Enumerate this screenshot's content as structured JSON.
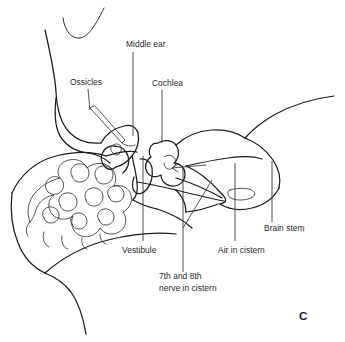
{
  "figure": {
    "panel_letter": "C",
    "background_color": "#ffffff",
    "line_color": "#1b1b1f",
    "text_color": "#26262b",
    "width": 345,
    "height": 342,
    "modality": "line-drawing"
  },
  "labels": {
    "middle_ear": "Middle ear",
    "ossicles": "Ossicles",
    "cochlea": "Cochlea",
    "vestibule": "Vestibule",
    "nerve_line1": "7th and 8th",
    "nerve_line2": "nerve in cistern",
    "air_in_cistern": "Air in cistern",
    "brain_stem": "Brain stem"
  },
  "label_positions": {
    "middle_ear": {
      "x": 126,
      "y": 47,
      "anchor": "start"
    },
    "ossicles": {
      "x": 70,
      "y": 85,
      "anchor": "start"
    },
    "cochlea": {
      "x": 152,
      "y": 86,
      "anchor": "start"
    },
    "vestibule": {
      "x": 122,
      "y": 253,
      "anchor": "start"
    },
    "nerve_line1": {
      "x": 159,
      "y": 279,
      "anchor": "start"
    },
    "nerve_line2": {
      "x": 159,
      "y": 291,
      "anchor": "start"
    },
    "air_in_cistern": {
      "x": 218,
      "y": 253,
      "anchor": "start"
    },
    "brain_stem": {
      "x": 264,
      "y": 231,
      "anchor": "start"
    },
    "panel_letter": {
      "x": 299,
      "y": 320,
      "anchor": "start"
    }
  },
  "leaders": [
    {
      "name": "middle-ear-leader",
      "d": "M 133 52 L 133 136"
    },
    {
      "name": "ossicles-leader",
      "d": "M 88 89 L 90 110"
    },
    {
      "name": "cochlea-leader",
      "d": "M 162 90 L 162 143"
    },
    {
      "name": "vestibule-leader",
      "d": "M 143 156 L 143 241"
    },
    {
      "name": "nerve-leader-vertical",
      "d": "M 183 168 L 183 272"
    },
    {
      "name": "nerve-leader-diagonal",
      "d": "M 183 228 L 212 180"
    },
    {
      "name": "air-in-cistern-leader",
      "d": "M 235 163 L 235 241"
    },
    {
      "name": "brain-stem-leader",
      "d": "M 272 161 L 272 222"
    }
  ],
  "anatomy_paths": [
    {
      "name": "pinna-arc",
      "weight": "thin",
      "d": "M 63 18 C 65 32 72 39 80 38 C 90 36 97 22 104 8"
    },
    {
      "name": "scalp-outline-upper",
      "weight": "main",
      "d": "M 45 30 C 50 52 55 74 56 92 C 57 110 61 124 70 133 C 78 141 90 144 101 143"
    },
    {
      "name": "scalp-outline-lower",
      "weight": "main",
      "d": "M 56 98 C 54 116 55 130 62 139 C 68 147 78 152 88 153"
    },
    {
      "name": "skull-base-left",
      "weight": "main",
      "d": "M 12 193 C 20 175 36 161 56 156 C 76 151 94 152 106 156"
    },
    {
      "name": "neck-outline-left",
      "weight": "main",
      "d": "M 12 193 C 10 210 12 228 18 243 C 24 258 34 268 45 273"
    },
    {
      "name": "neck-outline-lower",
      "weight": "main",
      "d": "M 45 273 C 55 277 64 283 71 292 C 78 302 83 316 86 334"
    },
    {
      "name": "skull-base-right",
      "weight": "main",
      "d": "M 45 273 C 62 258 84 246 108 240 C 132 234 156 232 176 234"
    },
    {
      "name": "posterior-fossa-rim",
      "weight": "main",
      "d": "M 106 156 C 118 152 128 150 137 152"
    },
    {
      "name": "mastoid-cells-outer",
      "weight": "fine",
      "d": "M 30 222 C 26 212 28 200 36 192 C 43 184 52 180 60 178 C 55 170 60 162 69 160 C 78 158 84 162 87 168 C 94 162 104 162 110 167 C 116 172 117 180 114 186 C 122 184 129 188 131 195 C 133 202 129 209 123 212 C 128 219 126 228 119 232 C 112 236 104 234 100 228 C 96 236 86 239 79 235 C 72 231 70 223 73 216 C 66 221 57 220 52 214 C 47 208 48 199 54 195 C 46 196 38 202 36 210 C 34 217 31 221 30 222 Z"
    },
    {
      "name": "mastoid-cell-a",
      "weight": "fine",
      "d": "M 48 192 C 44 188 45 181 50 178 C 55 175 61 177 63 182 C 65 187 62 193 57 194 C 53 195 50 194 48 192 Z"
    },
    {
      "name": "mastoid-cell-b",
      "weight": "fine",
      "d": "M 72 176 C 69 171 72 165 78 164 C 84 163 89 167 89 173 C 89 178 85 182 80 182 C 76 182 73 180 72 176 Z"
    },
    {
      "name": "mastoid-cell-c",
      "weight": "fine",
      "d": "M 96 178 C 93 173 96 167 102 166 C 108 165 113 169 113 175 C 113 180 109 184 104 184 C 100 184 97 182 96 178 Z"
    },
    {
      "name": "mastoid-cell-d",
      "weight": "fine",
      "d": "M 60 205 C 57 200 60 194 66 193 C 72 192 77 196 77 202 C 77 207 73 211 68 211 C 64 211 61 209 60 205 Z"
    },
    {
      "name": "mastoid-cell-e",
      "weight": "fine",
      "d": "M 86 200 C 83 195 86 189 92 188 C 98 187 103 191 103 197 C 103 202 99 206 94 206 C 90 206 87 204 86 200 Z"
    },
    {
      "name": "mastoid-cell-f",
      "weight": "fine",
      "d": "M 109 197 C 106 193 108 187 114 186 C 119 185 124 189 124 194 C 124 199 120 202 116 202 C 112 202 110 200 109 197 Z"
    },
    {
      "name": "mastoid-cell-g",
      "weight": "fine",
      "d": "M 44 218 C 41 214 43 208 49 207 C 54 206 59 210 59 215 C 59 220 55 223 51 223 C 47 223 45 221 44 218 Z"
    },
    {
      "name": "mastoid-cell-h",
      "weight": "fine",
      "d": "M 72 224 C 69 220 71 214 77 213 C 82 212 87 216 87 221 C 87 226 83 229 79 229 C 75 229 73 227 72 224 Z"
    },
    {
      "name": "mastoid-cell-i",
      "weight": "fine",
      "d": "M 99 220 C 96 216 98 210 104 209 C 109 208 114 212 114 217 C 114 222 110 225 106 225 C 102 225 100 223 99 220 Z"
    },
    {
      "name": "mastoid-fringe-1",
      "weight": "fine",
      "d": "M 30 222 C 26 226 25 232 28 236"
    },
    {
      "name": "mastoid-fringe-2",
      "weight": "fine",
      "d": "M 44 232 C 42 238 44 245 49 247"
    },
    {
      "name": "mastoid-fringe-3",
      "weight": "fine",
      "d": "M 62 236 C 61 242 63 248 68 249"
    },
    {
      "name": "mastoid-fringe-4",
      "weight": "fine",
      "d": "M 82 238 C 81 243 83 248 87 249"
    },
    {
      "name": "mastoid-fringe-5",
      "weight": "fine",
      "d": "M 100 234 C 100 239 102 243 106 244"
    },
    {
      "name": "epitympanum-outline",
      "weight": "main",
      "d": "M 101 143 C 106 134 115 128 124 126 C 131 124 136 127 138 133 C 140 141 137 150 132 156 C 127 162 121 166 116 167"
    },
    {
      "name": "middle-ear-cavity",
      "weight": "main",
      "d": "M 116 167 C 112 170 108 170 105 167 C 101 163 100 157 103 152 C 105 148 110 145 115 146"
    },
    {
      "name": "tympanic-wall",
      "weight": "main",
      "d": "M 115 146 C 121 146 126 150 128 156 C 130 162 128 169 123 173"
    },
    {
      "name": "ossicle-body",
      "weight": "fine",
      "d": "M 113 153 C 110 151 110 147 113 145 C 116 143 120 144 121 147 C 122 151 120 154 117 155 C 115 155 114 154 113 153 Z"
    },
    {
      "name": "ossicles-pointer",
      "weight": "fine",
      "d": "M 90 108 L 122 143 L 125 140 L 95 106 Z"
    },
    {
      "name": "ossicles-pointer-tip",
      "weight": "fine",
      "d": "M 122 143 C 126 146 131 147 135 145"
    },
    {
      "name": "eac-upper",
      "weight": "main",
      "d": "M 88 153 C 96 154 104 158 110 163"
    },
    {
      "name": "iac-descender",
      "weight": "main",
      "d": "M 132 156 C 134 165 136 173 137 182 C 138 190 137 196 133 200"
    },
    {
      "name": "vestibule-body",
      "weight": "main",
      "d": "M 140 159 C 146 158 151 162 152 168 C 153 176 151 184 147 189 C 143 194 138 195 135 192 C 132 189 132 183 134 177"
    },
    {
      "name": "cochlea-outer",
      "weight": "main",
      "d": "M 158 143 C 164 139 172 140 176 145 C 180 151 179 159 174 163 C 180 163 185 168 185 174 C 185 181 180 186 173 186 C 166 186 161 181 161 175 C 156 178 150 177 147 172 C 144 167 146 160 151 157 C 148 153 149 147 153 144 C 155 143 157 143 158 143 Z"
    },
    {
      "name": "cochlea-turn-inner",
      "weight": "fine",
      "d": "M 164 157 C 168 154 173 155 175 159 C 177 163 175 168 171 169 C 167 170 164 167 164 163"
    },
    {
      "name": "petrous-ridge-upper",
      "weight": "main",
      "d": "M 176 145 C 186 136 198 131 211 130 C 224 129 236 132 245 138"
    },
    {
      "name": "petrous-apex-curve",
      "weight": "main",
      "d": "M 245 138 C 252 130 262 122 274 115 C 290 106 310 99 334 96"
    },
    {
      "name": "cerebellum-upper",
      "weight": "main",
      "d": "M 245 138 C 256 142 266 150 273 160 C 279 169 281 179 279 188"
    },
    {
      "name": "cerebellum-lower",
      "weight": "main",
      "d": "M 279 188 C 274 198 264 205 252 208 C 240 211 228 209 220 204"
    },
    {
      "name": "brainstem-medial",
      "weight": "main",
      "d": "M 186 166 C 198 171 210 181 220 192 C 226 198 229 202 220 204"
    },
    {
      "name": "cistern-upper-edge",
      "weight": "main",
      "d": "M 186 166 C 199 163 214 160 228 158 C 242 156 254 156 262 159"
    },
    {
      "name": "cistern-arrow-shaft",
      "weight": "fine",
      "d": "M 172 168 L 206 165"
    },
    {
      "name": "cistern-arrow-head",
      "weight": "fine",
      "d": "M 178 164 L 172 168 L 178 172"
    },
    {
      "name": "nerve-bundle-upper",
      "weight": "main",
      "d": "M 176 178 C 192 183 208 190 222 198"
    },
    {
      "name": "nerve-bundle-lower",
      "weight": "main",
      "d": "M 176 190 C 192 194 208 198 224 201"
    },
    {
      "name": "air-cistern-oval",
      "weight": "fine",
      "d": "M 230 190 C 240 187 251 188 254 192 C 257 196 250 200 240 200 C 231 200 227 196 228 193 C 228 191 229 190 230 190 Z"
    },
    {
      "name": "flocculus-curve",
      "weight": "main",
      "d": "M 176 190 C 182 196 186 204 186 212"
    },
    {
      "name": "cistern-floor",
      "weight": "main",
      "d": "M 186 212 C 196 211 208 208 218 204"
    },
    {
      "name": "temporal-lobe-edge",
      "weight": "main",
      "d": "M 137 182 C 150 184 163 187 176 190"
    },
    {
      "name": "jugular-curve",
      "weight": "main",
      "d": "M 133 200 C 140 204 148 207 157 209"
    },
    {
      "name": "lower-skull-curve",
      "weight": "main",
      "d": "M 157 209 C 170 213 182 219 192 228"
    }
  ]
}
